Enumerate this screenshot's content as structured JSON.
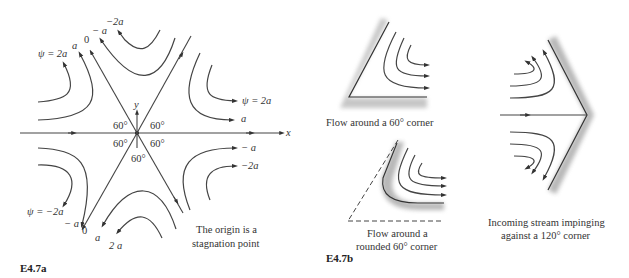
{
  "figure_a": {
    "label": "E4.7a",
    "axis_x": "x",
    "axis_y": "y",
    "angles": [
      "60°",
      "60°",
      "60°",
      "60°",
      "60°"
    ],
    "top_labels": {
      "psi_2a": "ψ = 2a",
      "a": "a",
      "zero": "0",
      "neg_a": "− a",
      "neg_2a": "−2a"
    },
    "right_labels": {
      "psi_2a": "ψ = 2a",
      "a": "a",
      "neg_a": "− a",
      "neg_2a": "−2a"
    },
    "bottom_labels": {
      "psi_neg_2a": "ψ = −2a",
      "neg_a": "− a",
      "zero": "0",
      "a": "a",
      "two_a": "2 a"
    },
    "note_line1": "The origin is a",
    "note_line2": "stagnation point"
  },
  "figure_b": {
    "label": "E4.7b",
    "caption_corner": "Flow around a 60° corner",
    "caption_rounded_line1": "Flow around a",
    "caption_rounded_line2": "rounded 60° corner",
    "caption_impinge_line1": "Incoming stream impinging",
    "caption_impinge_line2": "against a 120° corner"
  }
}
